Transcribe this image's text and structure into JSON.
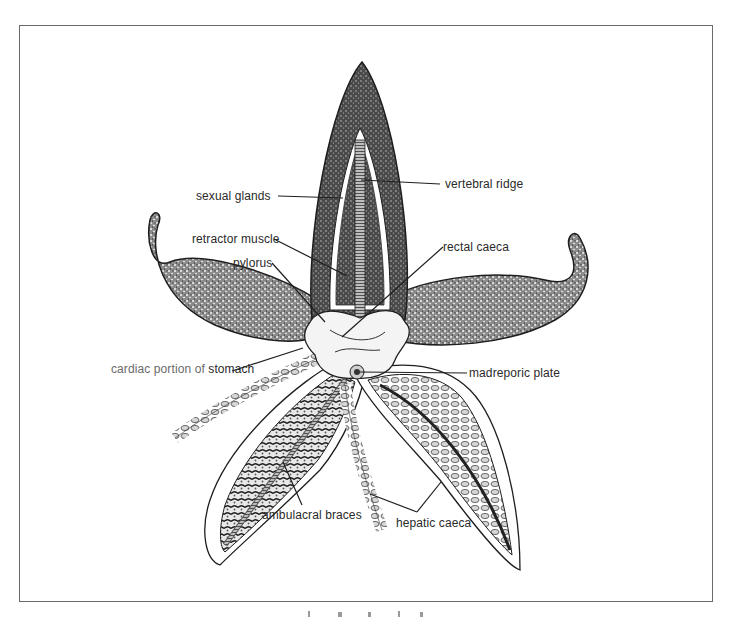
{
  "diagram": {
    "colors": {
      "ink": "#1e1e1e",
      "label_text": "#2a2a2a",
      "label_text_light": "#6a6a6a",
      "frame": "#6a6a6a",
      "background": "#ffffff"
    },
    "labels": {
      "sexual_glands": "sexual glands",
      "vertebral_ridge": "vertebral ridge",
      "retractor_muscle": "retractor muscle",
      "rectal_caeca": "rectal caeca",
      "pylorus": "pylorus",
      "cardiac_prefix": "cardiac portion of ",
      "cardiac_suffix": "stomach",
      "madreporic_plate": "madreporic plate",
      "ambulacral_braces": "ambulacral braces",
      "hepatic_caeca": "hepatic caeca"
    }
  }
}
